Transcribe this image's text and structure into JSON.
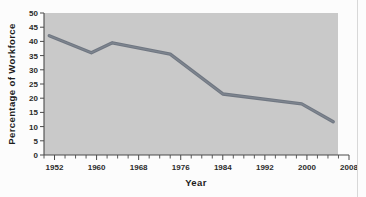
{
  "figure": {
    "background_color": "#fcfcfc",
    "plot_background_color": "#c9c9c9",
    "line_color": "#707782"
  },
  "chart_data": {
    "type": "line",
    "title": "",
    "xlabel": "Year",
    "ylabel": "Percentage of  Workforce",
    "xlim": [
      1950,
      2008
    ],
    "ylim": [
      0,
      50
    ],
    "grid": false,
    "legend": null,
    "x_tick_labels": [
      "1952",
      "1960",
      "1968",
      "1976",
      "1984",
      "1992",
      "2000",
      "2008"
    ],
    "x_ticks": [
      1952,
      1960,
      1968,
      1976,
      1984,
      1992,
      2000,
      2008
    ],
    "x_minor_tick_interval": 2,
    "y_tick_labels": [
      "0",
      "5",
      "10",
      "15",
      "20",
      "25",
      "30",
      "35",
      "40",
      "45",
      "50"
    ],
    "y_ticks": [
      0,
      5,
      10,
      15,
      20,
      25,
      30,
      35,
      40,
      45,
      50
    ],
    "series": [
      {
        "name": "Percentage of Workforce",
        "x": [
          1951,
          1959,
          1963,
          1974,
          1984,
          1999,
          2005
        ],
        "values": [
          42.0,
          36.0,
          39.5,
          35.5,
          21.5,
          18.0,
          11.7
        ]
      }
    ]
  }
}
